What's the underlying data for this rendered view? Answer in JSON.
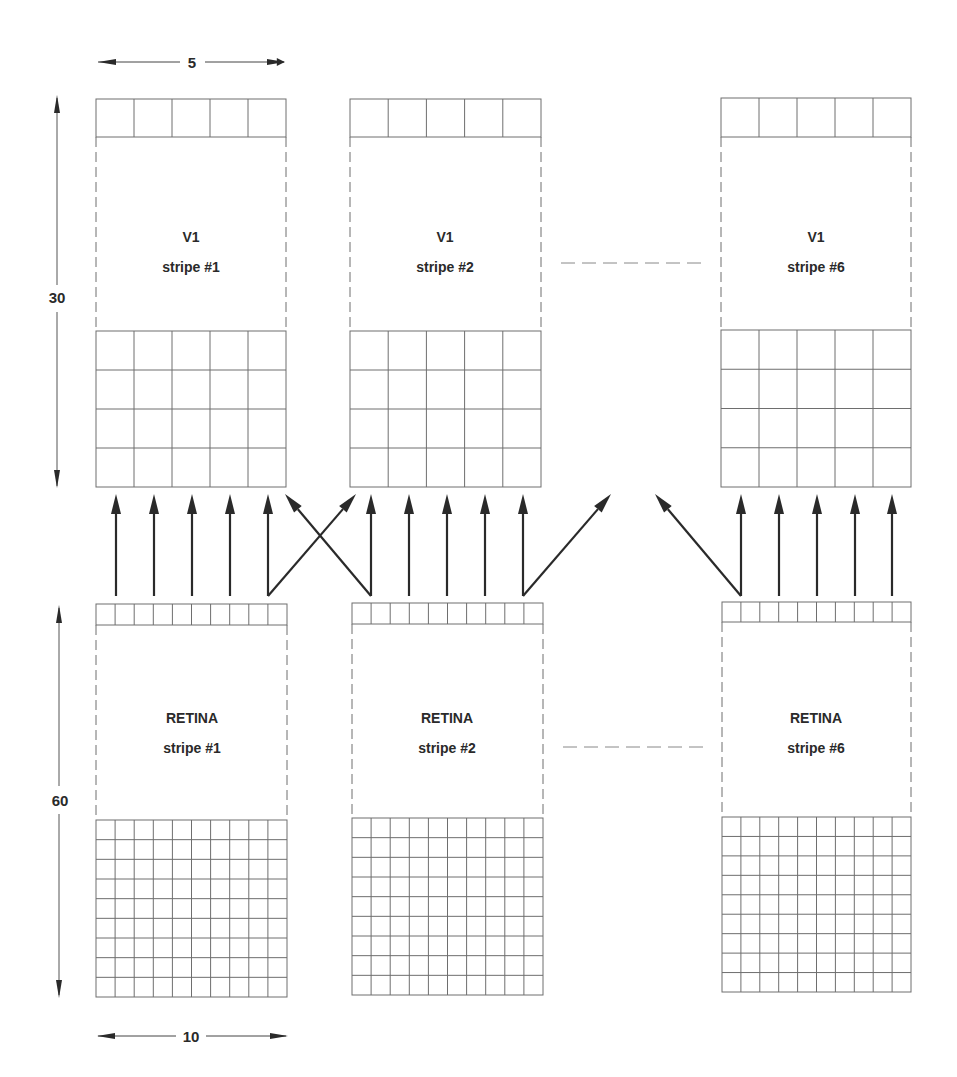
{
  "diagram": {
    "colors": {
      "line": "#6e6e6e",
      "arrow": "#2a2a2a",
      "text": "#2a2a2a",
      "background": "#ffffff"
    },
    "dimensions": {
      "v1_width_label": "5",
      "v1_height_label": "30",
      "retina_width_label": "10",
      "retina_height_label": "60"
    },
    "v1_stripes": [
      {
        "title": "V1",
        "subtitle": "stripe #1",
        "x": 96,
        "w": 190,
        "cols": 5,
        "top_row_y": 99,
        "top_row_h": 38,
        "grid_y": 331,
        "grid_rows": 4,
        "grid_h": 156
      },
      {
        "title": "V1",
        "subtitle": "stripe #2",
        "x": 350,
        "w": 191,
        "cols": 5,
        "top_row_y": 99,
        "top_row_h": 38,
        "grid_y": 331,
        "grid_rows": 4,
        "grid_h": 156
      },
      {
        "title": "V1",
        "subtitle": "stripe #6",
        "x": 721,
        "w": 190,
        "cols": 5,
        "top_row_y": 98,
        "top_row_h": 39,
        "grid_y": 330,
        "grid_rows": 4,
        "grid_h": 157
      }
    ],
    "retina_stripes": [
      {
        "title": "RETINA",
        "subtitle": "stripe #1",
        "x": 96,
        "w": 191,
        "cols": 10,
        "top_row_y": 604,
        "top_row_h": 21,
        "grid_y": 820,
        "grid_rows": 9,
        "grid_h": 177
      },
      {
        "title": "RETINA",
        "subtitle": "stripe #2",
        "x": 352,
        "w": 191,
        "cols": 10,
        "top_row_y": 603,
        "top_row_h": 21,
        "grid_y": 818,
        "grid_rows": 9,
        "grid_h": 177
      },
      {
        "title": "RETINA",
        "subtitle": "stripe #6",
        "x": 722,
        "w": 189,
        "cols": 10,
        "top_row_y": 602,
        "top_row_h": 20,
        "grid_y": 817,
        "grid_rows": 9,
        "grid_h": 175
      }
    ],
    "ellipsis_lines": [
      {
        "x1": 561,
        "x2": 703,
        "y": 263
      },
      {
        "x1": 563,
        "x2": 703,
        "y": 747
      }
    ],
    "projection_arrows": [
      {
        "x1": 116,
        "y1": 596,
        "x2": 116,
        "y2": 494
      },
      {
        "x1": 154,
        "y1": 596,
        "x2": 154,
        "y2": 494
      },
      {
        "x1": 192,
        "y1": 596,
        "x2": 192,
        "y2": 494
      },
      {
        "x1": 230,
        "y1": 596,
        "x2": 230,
        "y2": 494
      },
      {
        "x1": 268,
        "y1": 596,
        "x2": 268,
        "y2": 494
      },
      {
        "x1": 268,
        "y1": 596,
        "x2": 356,
        "y2": 494
      },
      {
        "x1": 371,
        "y1": 596,
        "x2": 285,
        "y2": 494
      },
      {
        "x1": 371,
        "y1": 596,
        "x2": 371,
        "y2": 494
      },
      {
        "x1": 409,
        "y1": 596,
        "x2": 409,
        "y2": 494
      },
      {
        "x1": 447,
        "y1": 596,
        "x2": 447,
        "y2": 494
      },
      {
        "x1": 485,
        "y1": 596,
        "x2": 485,
        "y2": 494
      },
      {
        "x1": 523,
        "y1": 596,
        "x2": 523,
        "y2": 494
      },
      {
        "x1": 523,
        "y1": 596,
        "x2": 611,
        "y2": 494
      },
      {
        "x1": 741,
        "y1": 596,
        "x2": 655,
        "y2": 494
      },
      {
        "x1": 741,
        "y1": 596,
        "x2": 741,
        "y2": 494
      },
      {
        "x1": 779,
        "y1": 596,
        "x2": 779,
        "y2": 494
      },
      {
        "x1": 817,
        "y1": 596,
        "x2": 817,
        "y2": 494
      },
      {
        "x1": 855,
        "y1": 596,
        "x2": 855,
        "y2": 494
      },
      {
        "x1": 892,
        "y1": 596,
        "x2": 892,
        "y2": 494
      }
    ]
  }
}
